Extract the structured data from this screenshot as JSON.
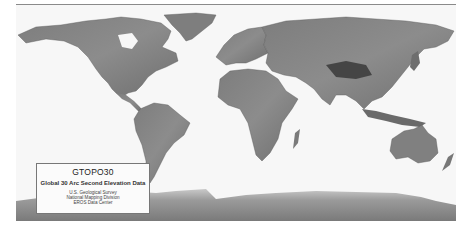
{
  "map": {
    "type": "shaded-relief world elevation map",
    "projection": "equirectangular",
    "colors": {
      "ocean": "#f7f7f7",
      "land_low": "#8a8a8a",
      "land_high": "#3a3a3a",
      "antarctica": "#9a9a9a",
      "frame": "#8a8a8a"
    },
    "regions": [
      "North America",
      "Greenland",
      "South America",
      "Europe",
      "Africa",
      "Asia",
      "Australia",
      "New Zealand",
      "Antarctica",
      "Madagascar",
      "Indonesia",
      "Japan"
    ]
  },
  "legend": {
    "title": "GTOPO30",
    "subtitle": "Global 30 Arc Second Elevation Data",
    "credits": [
      "U.S. Geological Survey",
      "National Mapping Division",
      "EROS Data Center"
    ]
  }
}
